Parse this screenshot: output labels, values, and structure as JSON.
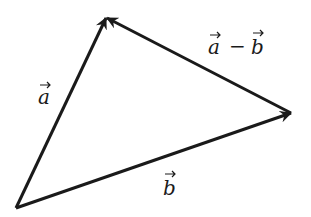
{
  "diagram": {
    "points": {
      "origin": {
        "x": 16,
        "y": 208
      },
      "a_tip": {
        "x": 106,
        "y": 18
      },
      "b_tip": {
        "x": 291,
        "y": 113
      }
    },
    "vectors": [
      {
        "id": "a",
        "label": "a",
        "from": "origin",
        "to": "a_tip"
      },
      {
        "id": "b",
        "label": "b",
        "from": "origin",
        "to": "b_tip"
      },
      {
        "id": "a_minus_b",
        "label": "a − b",
        "from": "b_tip",
        "to": "a_tip"
      }
    ],
    "labels": {
      "a": {
        "var": "a",
        "x": 38,
        "y": 104
      },
      "b": {
        "var": "b",
        "x": 163,
        "y": 192
      },
      "a_minus_b": {
        "var1": "a",
        "op": "−",
        "var2": "b",
        "x": 208,
        "y": 52
      }
    },
    "colors": {
      "stroke": "#1a1a1a",
      "background": "#ffffff"
    }
  }
}
